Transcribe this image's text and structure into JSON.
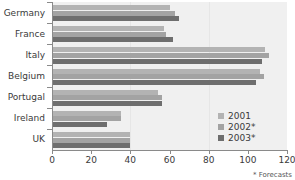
{
  "chart_data": {
    "type": "bar",
    "orientation": "horizontal",
    "title": "",
    "subtitle": "",
    "xlabel": "",
    "ylabel": "",
    "xlim": [
      0,
      120
    ],
    "xticks": [
      0,
      20,
      40,
      60,
      80,
      100,
      120
    ],
    "grid": false,
    "legend_position": "inside-right",
    "categories": [
      "Germany",
      "France",
      "Italy",
      "Belgium",
      "Portugal",
      "Ireland",
      "UK"
    ],
    "series": [
      {
        "name": "2001",
        "color": "#b3b3b3",
        "values": [
          60,
          57,
          109,
          106,
          54,
          35,
          40
        ]
      },
      {
        "name": "2002*",
        "color": "#a3a3a3",
        "values": [
          63,
          58,
          111,
          108,
          56,
          35,
          40
        ]
      },
      {
        "name": "2003*",
        "color": "#6e6e6e",
        "values": [
          65,
          62,
          107,
          104,
          56,
          28,
          40
        ]
      }
    ],
    "footnote": "* Forecasts",
    "plot_background": "#f0f0f0",
    "axis_color": "#8a8a8a",
    "text_color": "#3a3a3a"
  },
  "legend": {
    "items": [
      {
        "label": "2001"
      },
      {
        "label": "2002*"
      },
      {
        "label": "2003*"
      }
    ]
  },
  "footnote": {
    "text": "* Forecasts"
  }
}
